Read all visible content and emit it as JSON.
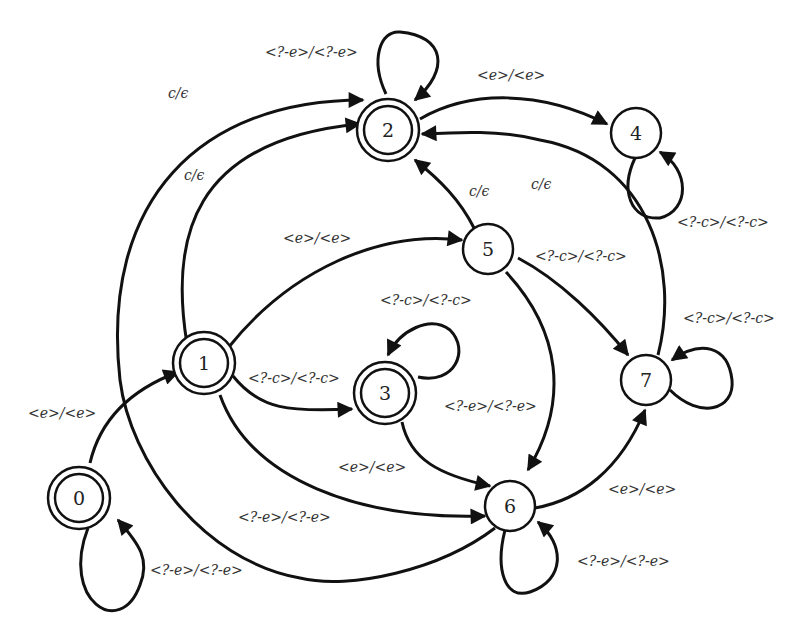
{
  "diagram": {
    "type": "finite-state transducer",
    "nodes": [
      {
        "id": "0",
        "label": "0",
        "accepting": true
      },
      {
        "id": "1",
        "label": "1",
        "accepting": true
      },
      {
        "id": "2",
        "label": "2",
        "accepting": true
      },
      {
        "id": "3",
        "label": "3",
        "accepting": true
      },
      {
        "id": "4",
        "label": "4",
        "accepting": false
      },
      {
        "id": "5",
        "label": "5",
        "accepting": false
      },
      {
        "id": "6",
        "label": "6",
        "accepting": false
      },
      {
        "id": "7",
        "label": "7",
        "accepting": false
      }
    ],
    "edges": [
      {
        "from": "0",
        "to": "0",
        "label": "<?-e>/<?-e>"
      },
      {
        "from": "0",
        "to": "1",
        "label": "<e>/<e>"
      },
      {
        "from": "1",
        "to": "2",
        "label": "c/ϵ"
      },
      {
        "from": "1",
        "to": "5",
        "label": "<e>/<e>"
      },
      {
        "from": "1",
        "to": "3",
        "label": "<?-c>/<?-c>"
      },
      {
        "from": "1",
        "to": "6",
        "label": "<?-e>/<?-e>"
      },
      {
        "from": "2",
        "to": "2",
        "label": "<?-e>/<?-e>"
      },
      {
        "from": "2",
        "to": "4",
        "label": "<e>/<e>"
      },
      {
        "from": "3",
        "to": "3",
        "label": "<?-c>/<?-c>"
      },
      {
        "from": "3",
        "to": "6",
        "label": "<e>/<e>"
      },
      {
        "from": "4",
        "to": "4",
        "label": "<?-c>/<?-c>"
      },
      {
        "from": "5",
        "to": "2",
        "label": "c/ϵ"
      },
      {
        "from": "5",
        "to": "7",
        "label": "<?-c>/<?-c>"
      },
      {
        "from": "5",
        "to": "6",
        "label": "<?-e>/<?-e>"
      },
      {
        "from": "6",
        "to": "6",
        "label": "<?-e>/<?-e>"
      },
      {
        "from": "6",
        "to": "7",
        "label": "<e>/<e>"
      },
      {
        "from": "6",
        "to": "2",
        "label": "c/ϵ"
      },
      {
        "from": "7",
        "to": "7",
        "label": "<?-c>/<?-c>"
      },
      {
        "from": "7",
        "to": "2",
        "label": "c/ϵ"
      }
    ]
  }
}
